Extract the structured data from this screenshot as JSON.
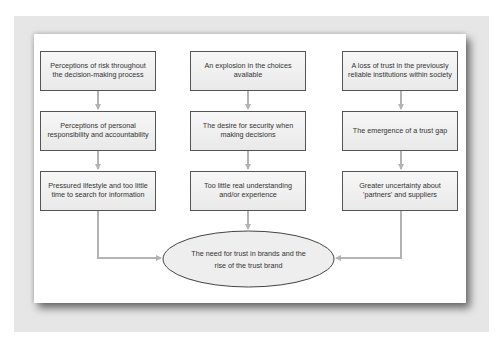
{
  "diagram": {
    "columns": [
      {
        "boxes": [
          "Perceptions of risk throughout the decision-making process",
          "Perceptions of personal responsibility and accountability",
          "Pressured lifestyle and too little time to search for information"
        ]
      },
      {
        "boxes": [
          "An explosion in the choices available",
          "The desire for security when making decisions",
          "Too little real understanding and/or experience"
        ]
      },
      {
        "boxes": [
          "A loss of trust in the previously reliable institutions within society",
          "The emergence of a trust gap",
          "Greater uncertainty about 'partners' and suppliers"
        ]
      }
    ],
    "outcome": "The need for trust in brands and the rise of the trust brand",
    "colors": {
      "frame": "#e6e6e6",
      "panel": "#ffffff",
      "box_border": "#555555",
      "arrow": "#b3b3b3",
      "ellipse_fill": "#eeeeee"
    }
  }
}
